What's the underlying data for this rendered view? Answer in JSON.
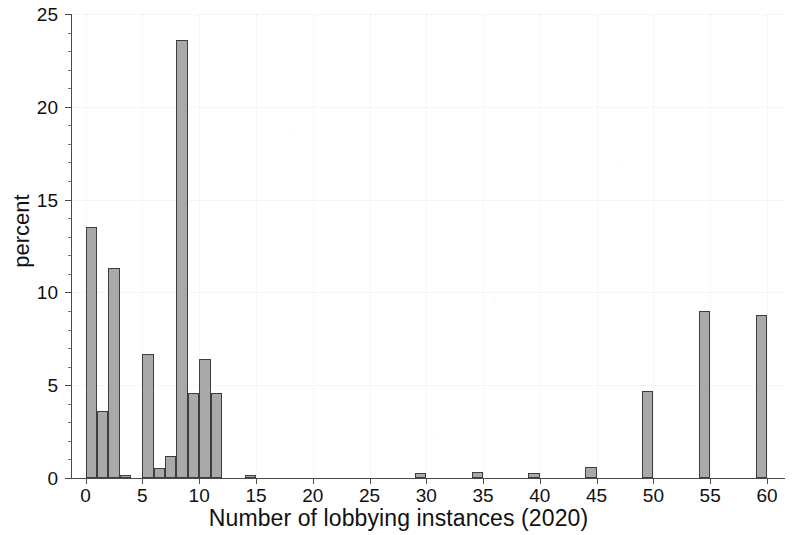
{
  "chart_data": {
    "type": "bar",
    "title": "",
    "subtitle": "",
    "xlabel": "Number of lobbying instances (2020)",
    "ylabel": "percent",
    "xlim": [
      -1.2,
      61.5
    ],
    "ylim": [
      0,
      25
    ],
    "xticks": [
      0,
      5,
      10,
      15,
      20,
      25,
      30,
      35,
      40,
      45,
      50,
      55,
      60
    ],
    "yticks": [
      0,
      5,
      10,
      15,
      20,
      25
    ],
    "xtick_labels": [
      "0",
      "5",
      "10",
      "15",
      "20",
      "25",
      "30",
      "35",
      "40",
      "45",
      "50",
      "55",
      "60"
    ],
    "ytick_labels": [
      "0",
      "5",
      "10",
      "15",
      "20",
      "25"
    ],
    "grid": "faint dotted gridlines at major ticks",
    "legend": "none",
    "bar_fill_color": "#a9a9a9",
    "bar_edge_color": "#3d3d3d",
    "axis_color": "#4a4a4a",
    "background_color": "#ffffff",
    "bin_width": 1,
    "categories": [
      0,
      1,
      2,
      3,
      4,
      5,
      6,
      7,
      8,
      9,
      10,
      11,
      12,
      15,
      30,
      35,
      40,
      45,
      50,
      55,
      60
    ],
    "values": [
      13.5,
      3.6,
      11.3,
      0.15,
      0,
      6.7,
      0.55,
      1.2,
      23.6,
      4.6,
      6.4,
      4.6,
      0,
      0.1,
      0.25,
      0.35,
      0.25,
      0.6,
      4.7,
      9.0,
      8.8
    ],
    "bars": [
      {
        "x": 0,
        "value": 13.5,
        "label": "13.5"
      },
      {
        "x": 1,
        "value": 3.6,
        "label": "3.6"
      },
      {
        "x": 2,
        "value": 11.3,
        "label": "11.3"
      },
      {
        "x": 3,
        "value": 0.15,
        "label": "0.15"
      },
      {
        "x": 5,
        "value": 6.7,
        "label": "6.7"
      },
      {
        "x": 6,
        "value": 0.55,
        "label": "0.55"
      },
      {
        "x": 7,
        "value": 1.2,
        "label": "1.2"
      },
      {
        "x": 8,
        "value": 23.6,
        "label": "23.6"
      },
      {
        "x": 9,
        "value": 4.6,
        "label": "4.6"
      },
      {
        "x": 10,
        "value": 6.4,
        "label": "6.4"
      },
      {
        "x": 11,
        "value": 4.6,
        "label": "4.6"
      },
      {
        "x": 14,
        "value": 0.12,
        "label": "0.12"
      },
      {
        "x": 29,
        "value": 0.25,
        "label": "0.25"
      },
      {
        "x": 34,
        "value": 0.35,
        "label": "0.35"
      },
      {
        "x": 39,
        "value": 0.25,
        "label": "0.25"
      },
      {
        "x": 44,
        "value": 0.6,
        "label": "0.6"
      },
      {
        "x": 49,
        "value": 4.7,
        "label": "4.7"
      },
      {
        "x": 54,
        "value": 9.0,
        "label": "9.0"
      },
      {
        "x": 59,
        "value": 8.8,
        "label": "8.8"
      }
    ]
  }
}
